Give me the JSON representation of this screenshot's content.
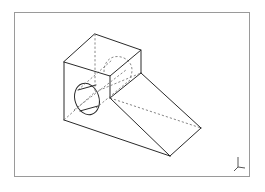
{
  "viewport": {
    "frame": {
      "left": 14,
      "top": 12,
      "right": 250,
      "bottom": 177,
      "border_color": "#9a9a9a"
    },
    "background": "#ffffff"
  },
  "drawing": {
    "type": "isometric wireframe CAD part",
    "description": "Rectangular block with a cylindrical through-hole on the left face and a sloped wedge extending to the lower right; hidden edges shown dashed",
    "line_color": "#2a2a2a",
    "hidden_line_color": "#6a6a6a",
    "vertices": {
      "top_back": [
        95,
        34
      ],
      "top_left": [
        64,
        62
      ],
      "top_right": [
        141,
        50
      ],
      "top_front": [
        110,
        76
      ],
      "left_bottom": [
        64,
        120
      ],
      "front_mid": [
        110,
        98
      ],
      "ramp_top": [
        141,
        73
      ],
      "ramp_right": [
        201,
        128
      ],
      "ramp_bottom": [
        170,
        156
      ]
    },
    "hole": {
      "cx": 87,
      "cy": 99,
      "rx": 13,
      "ry": 17
    }
  },
  "axis_triad": {
    "icon": "axis-triad-icon",
    "position": [
      238,
      166
    ]
  }
}
